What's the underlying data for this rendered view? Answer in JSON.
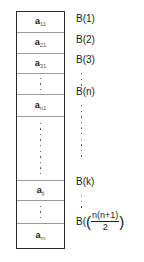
{
  "figure": {
    "type": "array-block-diagram",
    "colors": {
      "outer_border": "#2b2b2b",
      "cell_divider": "#9a9a9a",
      "text": "#1a1a1a",
      "subscript": "#555555",
      "dot": "#3a3a3a",
      "background": "#ffffff"
    }
  },
  "array": {
    "cells": [
      {
        "base": "a",
        "sub": "11",
        "kind": "element"
      },
      {
        "base": "a",
        "sub": "21",
        "kind": "element"
      },
      {
        "base": "a",
        "sub": "31",
        "kind": "element"
      },
      {
        "base": "",
        "sub": "",
        "kind": "ellipsis"
      },
      {
        "base": "a",
        "sub": "n1",
        "kind": "element"
      },
      {
        "base": "",
        "sub": "",
        "kind": "ellipsis"
      },
      {
        "base": "a",
        "sub": "ij",
        "kind": "element"
      },
      {
        "base": "",
        "sub": "",
        "kind": "ellipsis"
      },
      {
        "base": "a",
        "sub": "m",
        "kind": "element"
      }
    ]
  },
  "labels": {
    "items": [
      {
        "text": "B(1)",
        "kind": "label"
      },
      {
        "text": "B(2)",
        "kind": "label"
      },
      {
        "text": "B(3)",
        "kind": "label"
      },
      {
        "text": "",
        "kind": "ellipsis"
      },
      {
        "text": "B(n)",
        "kind": "label"
      },
      {
        "text": "",
        "kind": "ellipsis"
      },
      {
        "text": "B(k)",
        "kind": "label"
      },
      {
        "text": "",
        "kind": "ellipsis"
      }
    ],
    "last": {
      "prefix": "B(",
      "numerator": "n(n+1)",
      "denominator": "2",
      "suffix": ")"
    }
  }
}
